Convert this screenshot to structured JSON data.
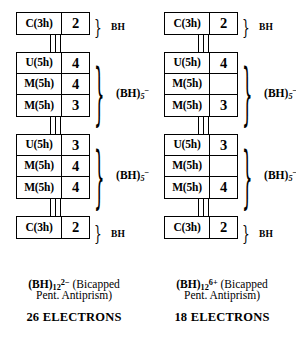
{
  "figure": {
    "type": "diagram"
  },
  "columns": [
    {
      "id": "left",
      "groups": [
        {
          "id": "cap-top",
          "brace": "small",
          "brace_label_html": "BH",
          "rows": [
            {
              "label": "C(3h)",
              "value": "2"
            }
          ]
        },
        {
          "id": "upper-pentagon",
          "brace": "big",
          "brace_label_html": "(BH)<sub>5</sub><sup>&minus;</sup>",
          "rows": [
            {
              "label": "U(5h)",
              "value": "4"
            },
            {
              "label": "M(5h)",
              "value": "4"
            },
            {
              "label": "M(5h)",
              "value": "3"
            }
          ]
        },
        {
          "id": "lower-pentagon",
          "brace": "big",
          "brace_label_html": "(BH)<sub>5</sub><sup>&minus;</sup>",
          "rows": [
            {
              "label": "U(5h)",
              "value": "3"
            },
            {
              "label": "M(5h)",
              "value": "4"
            },
            {
              "label": "M(5h)",
              "value": "4"
            }
          ]
        },
        {
          "id": "cap-bottom",
          "brace": "small",
          "brace_label_html": "BH",
          "rows": [
            {
              "label": "C(3h)",
              "value": "2"
            }
          ]
        }
      ],
      "caption_formula_html": "(BH)<sub>12</sub><sup>2&minus;</sup>",
      "caption_rest_line1": " (Bicapped",
      "caption_line2": "Pent. Antiprism)",
      "electrons": "26 ELECTRONS"
    },
    {
      "id": "right",
      "groups": [
        {
          "id": "cap-top",
          "brace": "small",
          "brace_label_html": "BH",
          "rows": [
            {
              "label": "C(3h)",
              "value": "2"
            }
          ]
        },
        {
          "id": "upper-pentagon",
          "brace": "big",
          "brace_label_html": "(BH)<sub>5</sub><sup>&minus;</sup>",
          "rows": [
            {
              "label": "U(5h)",
              "value": "4"
            },
            {
              "label": "M(5h)",
              "value": ""
            },
            {
              "label": "M(5h)",
              "value": "3"
            }
          ]
        },
        {
          "id": "lower-pentagon",
          "brace": "big",
          "brace_label_html": "(BH)<sub>5</sub><sup>&minus;</sup>",
          "rows": [
            {
              "label": "U(5h)",
              "value": "3"
            },
            {
              "label": "M(5h)",
              "value": ""
            },
            {
              "label": "M(5h)",
              "value": "4"
            }
          ]
        },
        {
          "id": "cap-bottom",
          "brace": "small",
          "brace_label_html": "BH",
          "rows": [
            {
              "label": "C(3h)",
              "value": "2"
            }
          ]
        }
      ],
      "caption_formula_html": "(BH)<sub>12</sub><sup>6+</sup>",
      "caption_rest_line1": " (Bicapped",
      "caption_line2": "Pent. Antiprism)",
      "electrons": "18 ELECTRONS"
    }
  ],
  "brace_glyph": "}"
}
